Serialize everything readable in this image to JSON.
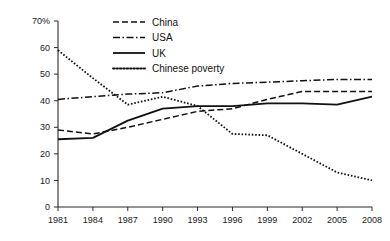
{
  "chart_data": {
    "type": "line",
    "title": "",
    "subtitle": "",
    "xlabel": "",
    "ylabel": "",
    "x": [
      1981,
      1984,
      1987,
      1990,
      1993,
      1996,
      1999,
      2002,
      2005,
      2008
    ],
    "categories": [
      "1981",
      "1984",
      "1987",
      "1990",
      "1993",
      "1996",
      "1999",
      "2002",
      "2005",
      "2008"
    ],
    "xlim": [
      1981,
      2008
    ],
    "ylim": [
      0,
      70
    ],
    "y_ticks": [
      0,
      10,
      20,
      30,
      40,
      50,
      60,
      70
    ],
    "y_tick_labels": [
      "0",
      "10",
      "20",
      "30",
      "40",
      "50",
      "60",
      "70%"
    ],
    "grid": false,
    "legend_position": "top-center",
    "series": [
      {
        "name": "China",
        "style": "dashed",
        "color": "#111111",
        "values": [
          29,
          27.5,
          30,
          33,
          36,
          37,
          40.5,
          43.5,
          43.5,
          43.5
        ]
      },
      {
        "name": "USA",
        "style": "dash-dot",
        "color": "#111111",
        "values": [
          40.5,
          41.5,
          42.5,
          43,
          45.5,
          46.5,
          47,
          47.5,
          48,
          48
        ]
      },
      {
        "name": "UK",
        "style": "solid",
        "color": "#111111",
        "values": [
          25.5,
          26,
          32.5,
          37,
          38,
          38,
          39,
          39,
          38.5,
          41.5
        ]
      },
      {
        "name": "Chinese poverty",
        "style": "dotted",
        "color": "#111111",
        "values": [
          59,
          48.5,
          38.5,
          41.5,
          38,
          27.5,
          27,
          20,
          13,
          10
        ]
      }
    ]
  },
  "legend": {
    "items": [
      {
        "label": "China"
      },
      {
        "label": "USA"
      },
      {
        "label": "UK"
      },
      {
        "label": "Chinese poverty"
      }
    ]
  }
}
